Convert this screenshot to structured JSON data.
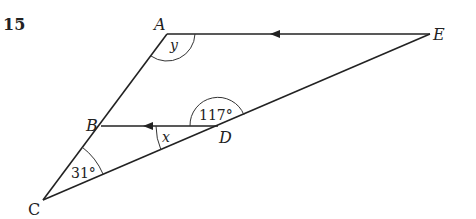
{
  "question_number": "15",
  "points": {
    "A": "A",
    "B": "B",
    "C": "C",
    "D": "D",
    "E": "E"
  },
  "angles": {
    "at_A": "y",
    "at_B_D": "x",
    "at_D": "117°",
    "at_C": "31°"
  },
  "segments": [
    "AE (arrow toward A)",
    "BD (arrow toward B)",
    "AC",
    "CE"
  ],
  "parallel_marks": "AE ∥ BD (single arrows)"
}
